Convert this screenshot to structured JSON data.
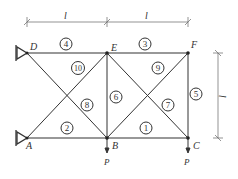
{
  "diagram": {
    "type": "truss",
    "nodes": [
      {
        "id": "D",
        "label": "D",
        "x": 27,
        "y": 53
      },
      {
        "id": "E",
        "label": "E",
        "x": 107,
        "y": 53
      },
      {
        "id": "F",
        "label": "F",
        "x": 188,
        "y": 53
      },
      {
        "id": "A",
        "label": "A",
        "x": 27,
        "y": 138
      },
      {
        "id": "B",
        "label": "B",
        "x": 107,
        "y": 138
      },
      {
        "id": "C",
        "label": "C",
        "x": 188,
        "y": 138
      }
    ],
    "members": [
      {
        "num": "1",
        "from": "B",
        "to": "C"
      },
      {
        "num": "2",
        "from": "A",
        "to": "B"
      },
      {
        "num": "3",
        "from": "E",
        "to": "F"
      },
      {
        "num": "4",
        "from": "D",
        "to": "E"
      },
      {
        "num": "5",
        "from": "F",
        "to": "C"
      },
      {
        "num": "6",
        "from": "E",
        "to": "B"
      },
      {
        "num": "7",
        "from": "E",
        "to": "C"
      },
      {
        "num": "8",
        "from": "D",
        "to": "B"
      },
      {
        "num": "9",
        "from": "B",
        "to": "F"
      },
      {
        "num": "10",
        "from": "A",
        "to": "E"
      }
    ],
    "supports": [
      "D",
      "A"
    ],
    "loads": [
      {
        "node": "B",
        "label": "P"
      },
      {
        "node": "C",
        "label": "P"
      }
    ],
    "dimensions": {
      "top_left": "l",
      "top_right": "l",
      "right": "l"
    }
  }
}
